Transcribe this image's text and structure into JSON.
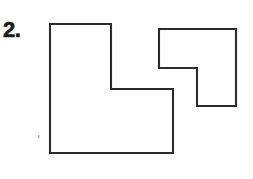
{
  "figure": {
    "problem_number": "2.",
    "background_color": "#ffffff",
    "stroke_color": "#2b2b2b",
    "fill_color": "#ffffff",
    "stroke_width": 2.1,
    "canvas": {
      "width": 253,
      "height": 179
    },
    "shapes": [
      {
        "name": "left-l-shape",
        "description": "L-shaped hexagon, upright orientation with foot extending to the right",
        "points": "50,24 111,24 111,89 173,89 173,153 50,153",
        "vertices": [
          [
            50,
            24
          ],
          [
            111,
            24
          ],
          [
            111,
            89
          ],
          [
            173,
            89
          ],
          [
            173,
            153
          ],
          [
            50,
            153
          ]
        ]
      },
      {
        "name": "right-l-shape",
        "description": "L-shaped hexagon rotated, notch cut from the lower-left",
        "points": "159,29 236,29 236,106 197,106 197,68 159,68",
        "vertices": [
          [
            159,
            29
          ],
          [
            236,
            29
          ],
          [
            236,
            106
          ],
          [
            197,
            106
          ],
          [
            197,
            68
          ],
          [
            159,
            68
          ]
        ]
      }
    ],
    "artifacts": [
      {
        "name": "scan-speck",
        "x": 38,
        "y": 135,
        "width": 1.6,
        "height": 3.2
      }
    ]
  }
}
